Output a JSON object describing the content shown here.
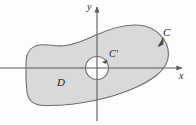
{
  "figure": {
    "background_color": "#fdfdfd",
    "region_fill_color": "#d9d9d9",
    "region_stroke_color": "#6e6e6e",
    "axis_color": "#5a5a5a",
    "label_color": "#1a1a1a"
  },
  "axes": {
    "x_label": "x",
    "y_label": "y",
    "origin": {
      "x": 97,
      "y": 68
    },
    "x_axis": {
      "start_x": 0,
      "end_x": 185,
      "y": 68,
      "arrow": "right"
    },
    "y_axis": {
      "x": 97,
      "start_y": 120,
      "end_y": 4,
      "arrow": "up"
    }
  },
  "curves": {
    "outer": {
      "label": "C",
      "orientation": "counterclockwise",
      "arrow_position": {
        "x": 161,
        "y": 41
      }
    },
    "inner": {
      "label": "C'",
      "orientation": "clockwise",
      "center": {
        "x": 97,
        "y": 68
      },
      "radius": 11.5,
      "arrow_position": {
        "x": 104,
        "y": 59
      }
    }
  },
  "region": {
    "label": "D",
    "label_position": {
      "x": 57,
      "y": 77
    }
  }
}
